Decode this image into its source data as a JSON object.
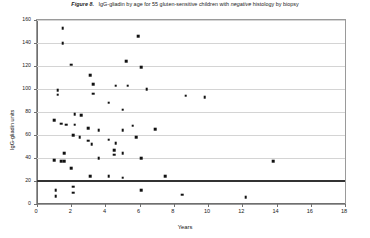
{
  "figure": {
    "label": "Figure 8.",
    "caption_part1": "IgG-gliadin by age for 55 gluten-sensitive children with ",
    "caption_emphasis": "negative",
    "caption_part2": " histology by biopsy"
  },
  "chart_data": {
    "type": "scatter",
    "xlabel": "Years",
    "ylabel": "IgG-gliadin units",
    "xlim": [
      0,
      18
    ],
    "ylim": [
      0,
      160
    ],
    "xticks": [
      0,
      2,
      4,
      6,
      8,
      10,
      12,
      14,
      16,
      18
    ],
    "yticks": [
      0,
      20,
      40,
      60,
      80,
      100,
      120,
      140,
      160
    ],
    "grid": "horizontal",
    "legend": "none",
    "marker": "square",
    "marker_color": "#111111",
    "n_points": 55,
    "reference_line": {
      "orientation": "horizontal",
      "value": 21,
      "color": "#333333",
      "width_px": 2
    },
    "points": [
      {
        "x": 1.5,
        "y": 153
      },
      {
        "x": 1.5,
        "y": 140
      },
      {
        "x": 2.0,
        "y": 121
      },
      {
        "x": 5.9,
        "y": 146
      },
      {
        "x": 5.2,
        "y": 124
      },
      {
        "x": 6.1,
        "y": 119
      },
      {
        "x": 3.1,
        "y": 112
      },
      {
        "x": 3.3,
        "y": 104
      },
      {
        "x": 4.6,
        "y": 103
      },
      {
        "x": 5.3,
        "y": 103
      },
      {
        "x": 6.4,
        "y": 100
      },
      {
        "x": 1.2,
        "y": 99
      },
      {
        "x": 1.2,
        "y": 95
      },
      {
        "x": 3.3,
        "y": 96
      },
      {
        "x": 4.2,
        "y": 88
      },
      {
        "x": 8.7,
        "y": 94
      },
      {
        "x": 9.8,
        "y": 93
      },
      {
        "x": 2.2,
        "y": 78
      },
      {
        "x": 2.6,
        "y": 77
      },
      {
        "x": 5.0,
        "y": 82
      },
      {
        "x": 1.0,
        "y": 73
      },
      {
        "x": 1.4,
        "y": 70
      },
      {
        "x": 1.7,
        "y": 69
      },
      {
        "x": 2.2,
        "y": 69
      },
      {
        "x": 3.0,
        "y": 66
      },
      {
        "x": 3.6,
        "y": 64
      },
      {
        "x": 5.0,
        "y": 64
      },
      {
        "x": 5.6,
        "y": 68
      },
      {
        "x": 6.9,
        "y": 65
      },
      {
        "x": 2.1,
        "y": 60
      },
      {
        "x": 2.5,
        "y": 58
      },
      {
        "x": 3.0,
        "y": 55
      },
      {
        "x": 3.2,
        "y": 52
      },
      {
        "x": 4.2,
        "y": 56
      },
      {
        "x": 4.6,
        "y": 53
      },
      {
        "x": 5.8,
        "y": 58
      },
      {
        "x": 1.6,
        "y": 44
      },
      {
        "x": 4.5,
        "y": 47
      },
      {
        "x": 1.0,
        "y": 38
      },
      {
        "x": 1.4,
        "y": 37
      },
      {
        "x": 1.6,
        "y": 37
      },
      {
        "x": 3.6,
        "y": 40
      },
      {
        "x": 4.5,
        "y": 43
      },
      {
        "x": 5.0,
        "y": 44
      },
      {
        "x": 6.1,
        "y": 40
      },
      {
        "x": 13.8,
        "y": 37
      },
      {
        "x": 2.0,
        "y": 31
      },
      {
        "x": 3.1,
        "y": 24
      },
      {
        "x": 4.2,
        "y": 24
      },
      {
        "x": 5.0,
        "y": 23
      },
      {
        "x": 7.5,
        "y": 24
      },
      {
        "x": 1.1,
        "y": 12
      },
      {
        "x": 1.1,
        "y": 7
      },
      {
        "x": 2.1,
        "y": 15
      },
      {
        "x": 2.1,
        "y": 10
      },
      {
        "x": 6.1,
        "y": 12
      },
      {
        "x": 8.5,
        "y": 8
      },
      {
        "x": 12.2,
        "y": 6
      }
    ]
  }
}
